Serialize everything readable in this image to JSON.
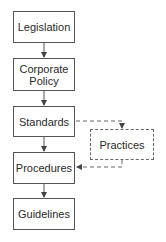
{
  "diagram": {
    "type": "flowchart",
    "main_flow": [
      {
        "id": "legislation",
        "label": "Legislation"
      },
      {
        "id": "corporate_policy",
        "label": "Corporate\nPolicy"
      },
      {
        "id": "standards",
        "label": "Standards"
      },
      {
        "id": "procedures",
        "label": "Procedures"
      },
      {
        "id": "guidelines",
        "label": "Guidelines"
      }
    ],
    "side_node": {
      "id": "practices",
      "label": "Practices",
      "style": "dashed"
    },
    "edges": [
      {
        "from": "legislation",
        "to": "corporate_policy",
        "style": "solid"
      },
      {
        "from": "corporate_policy",
        "to": "standards",
        "style": "solid"
      },
      {
        "from": "standards",
        "to": "procedures",
        "style": "solid"
      },
      {
        "from": "procedures",
        "to": "guidelines",
        "style": "solid"
      },
      {
        "from": "standards",
        "to": "practices",
        "style": "dashed"
      },
      {
        "from": "practices",
        "to": "procedures",
        "style": "dashed"
      }
    ],
    "colors": {
      "stroke": "#555555",
      "text": "#2a2a2a",
      "background": "#ffffff"
    }
  },
  "labels": {
    "legislation": "Legislation",
    "corporate_policy_line1": "Corporate",
    "corporate_policy_line2": "Policy",
    "standards": "Standards",
    "practices": "Practices",
    "procedures": "Procedures",
    "guidelines": "Guidelines"
  }
}
